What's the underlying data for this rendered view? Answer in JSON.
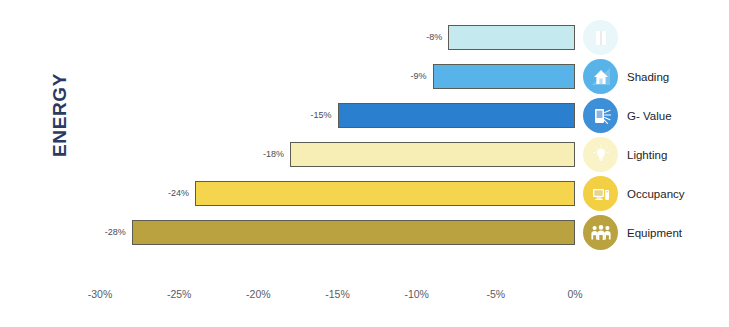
{
  "chart_data": {
    "type": "bar",
    "orientation": "horizontal",
    "title": "",
    "axis_title": "ENERGY",
    "xlabel": "",
    "ylabel": "ENERGY",
    "xlim": [
      -30,
      0
    ],
    "xticks": [
      -30,
      -25,
      -20,
      -15,
      -10,
      -5,
      0
    ],
    "xtick_labels": [
      "-30%",
      "-25%",
      "-20%",
      "-15%",
      "-10%",
      "-5%",
      "0%"
    ],
    "grid": false,
    "legend_position": "right-of-bars",
    "categories": [
      "",
      "Shading",
      "G- Value",
      "Lighting",
      "Occupancy",
      "Equipment"
    ],
    "values": [
      -8,
      -9,
      -15,
      -18,
      -24,
      -28
    ],
    "data_labels": [
      "-8%",
      "-9%",
      "-15%",
      "-18%",
      "-24%",
      "-28%"
    ],
    "bars": [
      {
        "label": "",
        "value": -8,
        "data_label": "-8%",
        "fill": "#c4e9ef",
        "stroke": "#5c5c52",
        "icon_name": "window-icon",
        "icon_bg": "#e9f7fb",
        "icon_fg": "#ffffff"
      },
      {
        "label": "Shading",
        "value": -9,
        "data_label": "-9%",
        "fill": "#58b4e8",
        "stroke": "#5c5c52",
        "icon_name": "shading-house-icon",
        "icon_bg": "#58b4e8",
        "icon_fg": "#ffffff"
      },
      {
        "label": "G- Value",
        "value": -15,
        "data_label": "-15%",
        "fill": "#2a7fce",
        "stroke": "#5c5c52",
        "icon_name": "glazing-sunrays-icon",
        "icon_bg": "#3d8fd8",
        "icon_fg": "#ffffff"
      },
      {
        "label": "Lighting",
        "value": -18,
        "data_label": "-18%",
        "fill": "#f6eeb4",
        "stroke": "#5c5c52",
        "icon_name": "lightbulb-icon",
        "icon_bg": "#faf3c8",
        "icon_fg": "#ffffff"
      },
      {
        "label": "Occupancy",
        "value": -24,
        "data_label": "-24%",
        "fill": "#f5d council",
        "stroke": "#5c5c52",
        "icon_name": "computer-monitor-icon",
        "icon_bg": "#f3cf43",
        "icon_fg": "#ffffff"
      },
      {
        "label": "Equipment",
        "value": -28,
        "data_label": "-28%",
        "fill": "#b8a košick",
        "stroke": "#5c5c52",
        "icon_name": "three-people-icon",
        "icon_bg": "#b9a23f",
        "icon_fg": "#ffffff"
      }
    ]
  },
  "colors": {
    "axis_title": "#2b3a63",
    "tick_text": "#5b5b63",
    "label_text": "#4a4a55",
    "legend_text": "#232326",
    "background": "#ffffff"
  }
}
